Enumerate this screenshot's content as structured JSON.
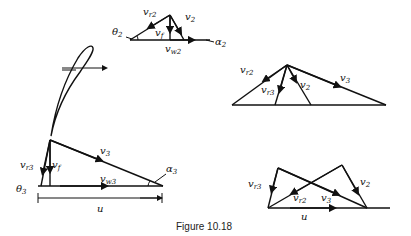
{
  "caption": "Figure 10.18",
  "inlet_triangle": {
    "labels": {
      "vr2": "v",
      "vr2_sub": "r2",
      "v2": "v",
      "v2_sub": "2",
      "vf": "v",
      "vf_sub": "f",
      "vw2": "v",
      "vw2_sub": "w2",
      "theta2": "θ",
      "theta2_sub": "2",
      "alpha2": "α",
      "alpha2_sub": "2"
    }
  },
  "outlet_triangle": {
    "labels": {
      "vr3": "v",
      "vr3_sub": "r3",
      "vf": "v",
      "vf_sub": "f",
      "v3": "v",
      "v3_sub": "3",
      "vw3": "v",
      "vw3_sub": "w3",
      "theta3": "θ",
      "theta3_sub": "3",
      "alpha3": "α",
      "alpha3_sub": "3",
      "u": "u"
    }
  },
  "combined_top": {
    "labels": {
      "vr2": "v",
      "vr2_sub": "r2",
      "vr3": "v",
      "vr3_sub": "r3",
      "v2": "v",
      "v2_sub": "2",
      "v3": "v",
      "v3_sub": "3"
    }
  },
  "combined_bottom": {
    "labels": {
      "vr3": "v",
      "vr3_sub": "r3",
      "vr2": "v",
      "vr2_sub": "r2",
      "v3": "v",
      "v3_sub": "3",
      "v2": "v",
      "v2_sub": "2",
      "u": "u"
    }
  }
}
